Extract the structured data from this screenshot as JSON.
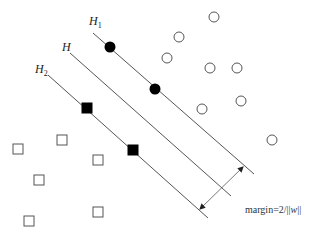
{
  "diagram": {
    "colors": {
      "line": "#555555",
      "marker_fill": "#000000",
      "open_marker": "#555555",
      "background": "#ffffff"
    },
    "labels": {
      "h1": {
        "main": "H",
        "sub": "1",
        "x": 89,
        "y": 25
      },
      "h": {
        "main": "H",
        "x": 62,
        "y": 51
      },
      "h2": {
        "main": "H",
        "sub": "2",
        "x": 35,
        "y": 73
      }
    },
    "lines": [
      {
        "name": "H1",
        "x1": 93,
        "y1": 33,
        "x2": 254,
        "y2": 174
      },
      {
        "name": "H",
        "x1": 70,
        "y1": 53,
        "x2": 231,
        "y2": 196
      },
      {
        "name": "H2",
        "x1": 48,
        "y1": 75,
        "x2": 208,
        "y2": 218
      }
    ],
    "margin_arrow": {
      "x1": 200,
      "y1": 209,
      "x2": 243,
      "y2": 167
    },
    "margin_label": "margin=2/||w||",
    "margin_label_parts": {
      "prefix": "margin=2/",
      "open": "||",
      "var": "w",
      "close": "||"
    },
    "support_vectors_class_pos": [
      {
        "x": 110,
        "y": 47
      },
      {
        "x": 155,
        "y": 89
      }
    ],
    "support_vectors_class_neg": [
      {
        "x": 87,
        "y": 108
      },
      {
        "x": 133,
        "y": 150
      }
    ],
    "class_pos_points": [
      {
        "x": 214,
        "y": 17
      },
      {
        "x": 179,
        "y": 37
      },
      {
        "x": 167,
        "y": 58
      },
      {
        "x": 210,
        "y": 68
      },
      {
        "x": 237,
        "y": 68
      },
      {
        "x": 241,
        "y": 101
      },
      {
        "x": 202,
        "y": 109
      },
      {
        "x": 272,
        "y": 140
      }
    ],
    "class_neg_points": [
      {
        "x": 18,
        "y": 149
      },
      {
        "x": 62,
        "y": 140
      },
      {
        "x": 98,
        "y": 160
      },
      {
        "x": 39,
        "y": 180
      },
      {
        "x": 29,
        "y": 221
      },
      {
        "x": 98,
        "y": 212
      }
    ]
  }
}
